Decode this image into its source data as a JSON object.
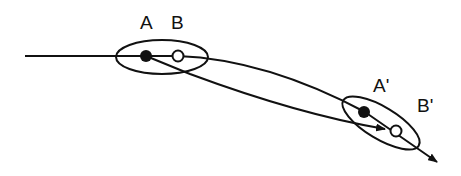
{
  "diagram": {
    "labels": {
      "a": "A",
      "b": "B",
      "a_prime": "A'",
      "b_prime": "B'"
    },
    "colors": {
      "stroke": "#111111",
      "background": "#ffffff"
    },
    "elements": {
      "initial_group": "ellipse containing points A and B",
      "final_group": "rotated ellipse containing points A' and B'",
      "path_a": "straight arrow from A to near B'",
      "path_b": "curved arrow from B through A' continuing beyond"
    }
  }
}
